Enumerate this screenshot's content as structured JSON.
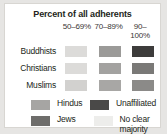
{
  "chart_data": {
    "type": "table",
    "title": "Percent of all adherents",
    "xlabel": "",
    "ylabel": "",
    "legend_position": "bottom",
    "categories": [
      "50–69%",
      "70–89%",
      "90–100%"
    ],
    "rows": [
      {
        "name": "Buddhists",
        "values": [
          "50–69%",
          "70–89%",
          "90–100%"
        ],
        "colors": [
          "#dcdbd9",
          "#9b9a98",
          "#3d3c3b"
        ]
      },
      {
        "name": "Christians",
        "values": [
          "50–69%",
          "70–89%",
          "90–100%"
        ],
        "colors": [
          "#dcdbd9",
          "#a3a2a0",
          "#7a7977"
        ]
      },
      {
        "name": "Muslims",
        "values": [
          "50–69%",
          "70–89%",
          "90–100%"
        ],
        "colors": [
          "#d2d1cf",
          "#a8a7a5",
          "#8b8a88"
        ]
      }
    ]
  },
  "header": {
    "title": "Percent of all adherents"
  },
  "columns": [
    {
      "label": "50–69%"
    },
    {
      "label": "70–89%"
    },
    {
      "label": "90–100%"
    }
  ],
  "matrix": {
    "rows": [
      {
        "label": "Buddhists",
        "cells": [
          {
            "color": "#dcdbd9"
          },
          {
            "color": "#9b9a98"
          },
          {
            "color": "#3d3c3b"
          }
        ]
      },
      {
        "label": "Christians",
        "cells": [
          {
            "color": "#dcdbd9"
          },
          {
            "color": "#a3a2a0"
          },
          {
            "color": "#7a7977"
          }
        ]
      },
      {
        "label": "Muslims",
        "cells": [
          {
            "color": "#d2d1cf"
          },
          {
            "color": "#a8a7a5"
          },
          {
            "color": "#8b8a88"
          }
        ]
      }
    ]
  },
  "legend": {
    "entries": [
      {
        "label": "Hindus",
        "color": "#a6a5a3"
      },
      {
        "label": "Unaffiliated",
        "color": "#4a4948"
      },
      {
        "label": "Jews",
        "color": "#6e6d6b"
      },
      {
        "label": "No clear\nmajority",
        "color": "#ededeb"
      }
    ]
  }
}
